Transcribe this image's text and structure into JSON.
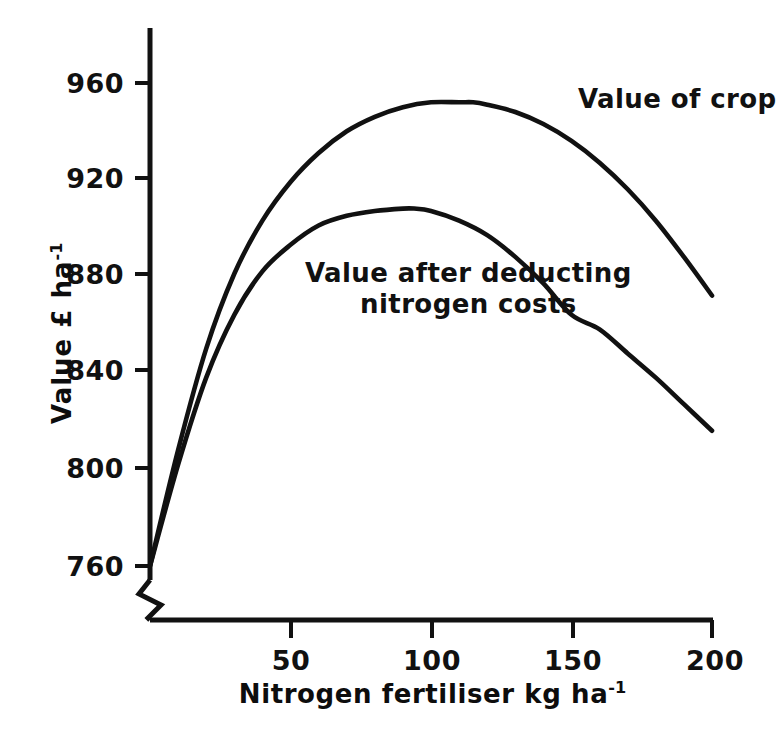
{
  "chart_data": {
    "type": "line",
    "title": "",
    "xlabel": "Nitrogen fertiliser kg ha-1",
    "xlabel_base": "Nitrogen fertiliser kg ha",
    "xlabel_exponent": "-1",
    "ylabel": "Value £ ha-1",
    "ylabel_base": "Value £ ha",
    "ylabel_exponent": "-1",
    "xlim": [
      0,
      200
    ],
    "ylim": [
      760,
      975
    ],
    "y_axis_break": true,
    "grid": false,
    "legend": "inline-annotations",
    "xticks": [
      50,
      100,
      150,
      200
    ],
    "xtick_labels": [
      "50",
      "100",
      "150",
      "200"
    ],
    "yticks": [
      760,
      800,
      840,
      880,
      920,
      960
    ],
    "ytick_labels": [
      "760",
      "800",
      "840",
      "880",
      "920",
      "960"
    ],
    "series": [
      {
        "name": "Value of crop",
        "label": "Value of crop",
        "color": "#111111",
        "x": [
          0,
          10,
          20,
          30,
          40,
          50,
          60,
          70,
          80,
          90,
          100,
          110,
          115,
          120,
          130,
          140,
          150,
          160,
          170,
          180,
          190,
          200
        ],
        "values": [
          760,
          808,
          850,
          881,
          903,
          919,
          931,
          940,
          946,
          950,
          952,
          952,
          952,
          951,
          948,
          943,
          936,
          927,
          916,
          903,
          888,
          872
        ]
      },
      {
        "name": "Value after deducting nitrogen costs",
        "label": "Value after deducting nitrogen costs",
        "label_line_1": "Value after deducting",
        "label_line_2": "nitrogen costs",
        "color": "#111111",
        "x": [
          0,
          10,
          20,
          30,
          40,
          50,
          60,
          70,
          80,
          90,
          94,
          100,
          110,
          120,
          130,
          140,
          150,
          160,
          170,
          180,
          190,
          200
        ],
        "values": [
          760,
          802,
          838,
          864,
          882,
          893,
          901,
          905,
          907,
          908,
          908,
          907,
          903,
          897,
          888,
          877,
          864,
          858,
          848,
          838,
          827,
          816
        ]
      }
    ]
  },
  "axes": {
    "y_axis_label_text": "Value £ ha",
    "y_axis_label_sup": "-1",
    "x_axis_label_text": "Nitrogen fertiliser kg ha",
    "x_axis_label_sup": "-1"
  },
  "ticks": {
    "y": [
      {
        "label": "960",
        "value": 960
      },
      {
        "label": "920",
        "value": 920
      },
      {
        "label": "880",
        "value": 880
      },
      {
        "label": "840",
        "value": 840
      },
      {
        "label": "800",
        "value": 800
      },
      {
        "label": "760",
        "value": 760
      }
    ],
    "x": [
      {
        "label": "50",
        "value": 50
      },
      {
        "label": "100",
        "value": 100
      },
      {
        "label": "150",
        "value": 150
      },
      {
        "label": "200",
        "value": 200
      }
    ]
  },
  "annotations": {
    "value_of_crop": "Value of crop",
    "value_after_deducting_line1": "Value after deducting",
    "value_after_deducting_line2": "nitrogen costs"
  },
  "colors": {
    "background": "#ffffff",
    "ink": "#111111",
    "curve": "#111111"
  }
}
